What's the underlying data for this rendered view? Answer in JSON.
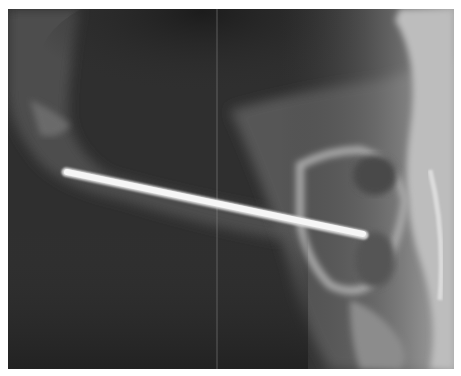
{
  "image": {
    "kind": "radiograph",
    "description": "Lateral X-ray showing a straight metal pin inserted through bone",
    "caption": ""
  },
  "colors": {
    "background": "#ffffff",
    "film_dark": "#2b2b2b",
    "soft_tissue": "#5a5a5a",
    "bone": "#b8b8b8",
    "pin": "#f4f4f4"
  },
  "objects": [
    {
      "name": "metal-pin",
      "from": [
        66,
        172
      ],
      "to": [
        364,
        235
      ],
      "width": 7
    },
    {
      "name": "film-seam-line",
      "x": 217
    }
  ]
}
